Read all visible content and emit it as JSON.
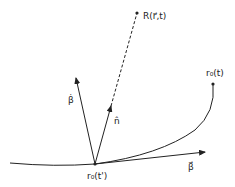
{
  "diagram": {
    "labels": {
      "observer_point": "R(r⃗,t)",
      "retarded_position": "r₀(t')",
      "current_position": "r₀(t)",
      "beta_dot": "β̇",
      "unit_normal": "n̂",
      "beta": "β⃗"
    },
    "colors": {
      "stroke": "#222222",
      "background": "#ffffff"
    }
  }
}
